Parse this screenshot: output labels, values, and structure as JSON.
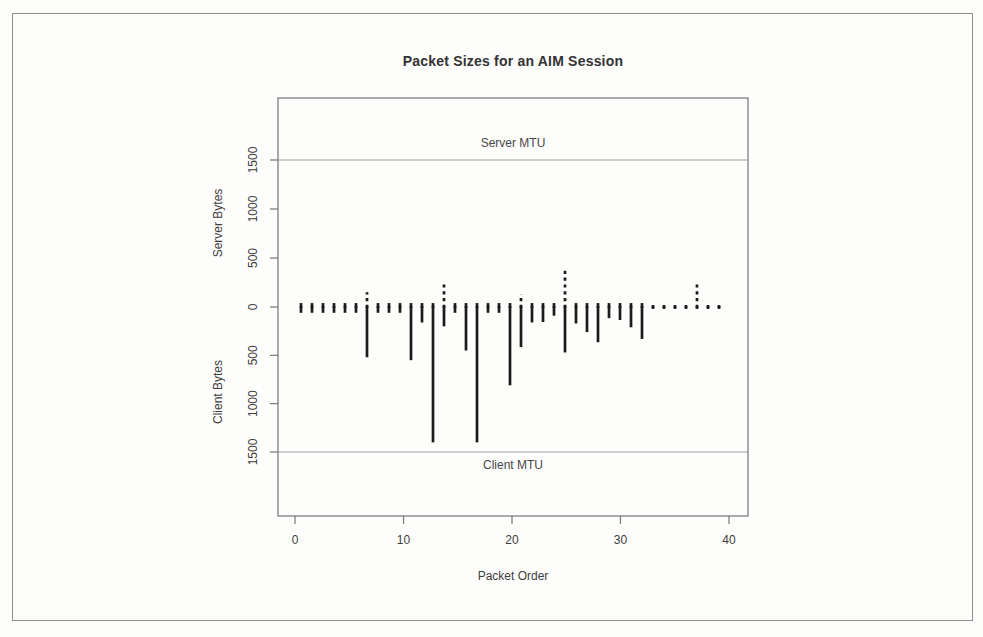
{
  "chart_data": {
    "type": "bar",
    "title": "Packet Sizes for an AIM Session",
    "xlabel": "Packet Order",
    "ylabels": [
      "Server Bytes",
      "Client Bytes"
    ],
    "xlim": [
      0,
      40
    ],
    "ylim_bytes": [
      -2200,
      2100
    ],
    "x_ticks": [
      0,
      10,
      20,
      30,
      40
    ],
    "y_tick_values": [
      1500,
      1000,
      500,
      0,
      -500,
      -1000,
      -1500
    ],
    "y_tick_labels": [
      "1500",
      "1000",
      "500",
      "0",
      "500",
      "1000",
      "1500"
    ],
    "grid": "off",
    "annotations": [
      {
        "text": "Server MTU",
        "value": 1500
      },
      {
        "text": "Client MTU",
        "value": -1500
      }
    ],
    "x": [
      1,
      2,
      3,
      4,
      5,
      6,
      7,
      8,
      9,
      10,
      11,
      12,
      13,
      14,
      15,
      16,
      17,
      18,
      19,
      20,
      21,
      22,
      23,
      24,
      25,
      26,
      27,
      28,
      29,
      30,
      31,
      32,
      33,
      34,
      35,
      36,
      37,
      38,
      39
    ],
    "series": [
      {
        "name": "Server Bytes",
        "direction": "up",
        "values": [
          40,
          40,
          40,
          40,
          40,
          40,
          150,
          40,
          40,
          40,
          40,
          40,
          40,
          260,
          40,
          40,
          40,
          40,
          40,
          40,
          130,
          40,
          40,
          40,
          370,
          40,
          40,
          40,
          40,
          40,
          40,
          40,
          20,
          20,
          20,
          20,
          250,
          20,
          20
        ]
      },
      {
        "name": "Client Bytes",
        "direction": "down",
        "values": [
          60,
          60,
          60,
          60,
          60,
          60,
          520,
          60,
          60,
          60,
          550,
          160,
          1400,
          200,
          60,
          450,
          1400,
          60,
          60,
          810,
          415,
          160,
          155,
          90,
          470,
          170,
          260,
          365,
          115,
          135,
          210,
          330,
          20,
          20,
          20,
          20,
          20,
          20,
          20
        ]
      }
    ],
    "colors": {
      "bars": "#1b1b1b",
      "axis": "#757575",
      "mtu_line": "#9e9e9e",
      "text": "#3d3d3d",
      "border": "#8f8f8f"
    }
  }
}
